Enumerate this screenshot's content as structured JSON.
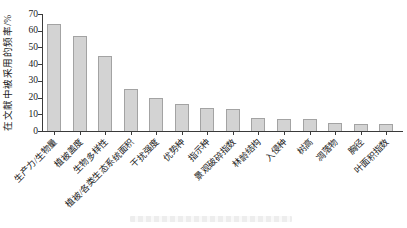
{
  "chart_data": {
    "type": "bar",
    "title": "",
    "xlabel": "",
    "ylabel": "在文献中被采用的频率/%",
    "ylim": [
      0,
      70
    ],
    "yticks": [
      0,
      10,
      20,
      30,
      40,
      50,
      60,
      70
    ],
    "categories": [
      "生产力/生物量",
      "植被盖度",
      "生物多样性",
      "植被/各类生态系统面积",
      "干扰强度",
      "优势种",
      "指示种",
      "景观破碎指数",
      "林龄结构",
      "入侵种",
      "树高",
      "凋落物",
      "胸径",
      "叶面积指数"
    ],
    "values": [
      64,
      57,
      45,
      25,
      20,
      16,
      14,
      13,
      8,
      7,
      7,
      5,
      4,
      4
    ],
    "bar_color": "#d3d3d3",
    "bar_border_color": "#a3a3a3",
    "axis_color": "#3a3a3a",
    "grid": false,
    "legend": "none",
    "x_label_rotation_deg": 45
  }
}
